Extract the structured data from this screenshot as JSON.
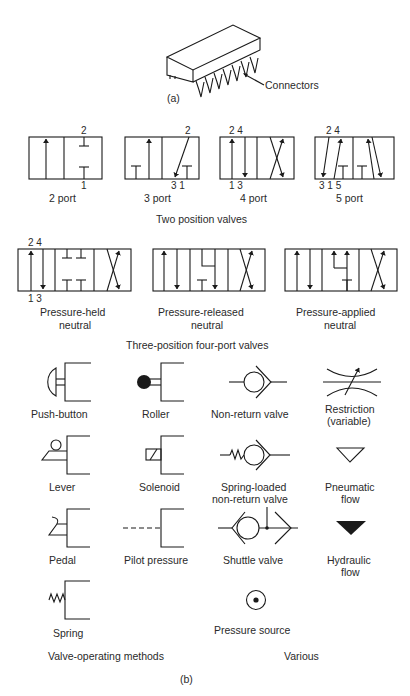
{
  "part_a": {
    "label": "(a)",
    "callout": "Connectors"
  },
  "two_position": {
    "title": "Two position valves",
    "valves": [
      {
        "label": "2 port",
        "ports_top": "2",
        "ports_bottom": "1"
      },
      {
        "label": "3 port",
        "ports_top": "2",
        "ports_bottom": "3 1"
      },
      {
        "label": "4 port",
        "ports_top": "2 4",
        "ports_bottom": "1 3"
      },
      {
        "label": "5 port",
        "ports_top": "2 4",
        "ports_bottom": "3 1 5"
      }
    ]
  },
  "three_position": {
    "title": "Three-position four-port valves",
    "ports_top": "2 4",
    "ports_bottom": "1 3",
    "valves": [
      {
        "label_line1": "Pressure-held",
        "label_line2": "neutral"
      },
      {
        "label_line1": "Pressure-released",
        "label_line2": "neutral"
      },
      {
        "label_line1": "Pressure-applied",
        "label_line2": "neutral"
      }
    ]
  },
  "operating_methods": {
    "title": "Valve-operating methods",
    "items": [
      {
        "label": "Push-button"
      },
      {
        "label": "Roller"
      },
      {
        "label": "Lever"
      },
      {
        "label": "Solenoid"
      },
      {
        "label": "Pedal"
      },
      {
        "label": "Pilot pressure"
      },
      {
        "label": "Spring"
      }
    ]
  },
  "various": {
    "title": "Various",
    "items": [
      {
        "label": "Non-return valve"
      },
      {
        "label_line1": "Restriction",
        "label_line2": "(variable)"
      },
      {
        "label_line1": "Spring-loaded",
        "label_line2": "non-return valve"
      },
      {
        "label_line1": "Pneumatic",
        "label_line2": "flow"
      },
      {
        "label": "Shuttle valve"
      },
      {
        "label_line1": "Hydraulic",
        "label_line2": "flow"
      },
      {
        "label": "Pressure source"
      }
    ]
  },
  "part_b": {
    "label": "(b)"
  }
}
